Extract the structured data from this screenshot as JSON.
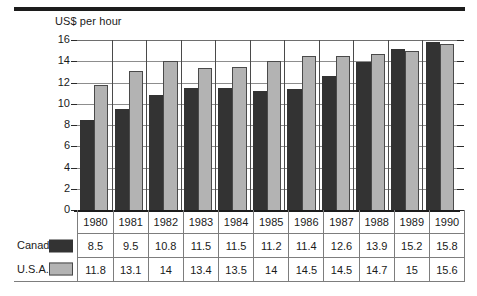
{
  "chart_data": {
    "type": "bar",
    "title": "",
    "subtitle": "",
    "ylabel": "US$ per hour",
    "xlabel": "",
    "ylim": [
      0,
      16
    ],
    "yticks": [
      0,
      2,
      4,
      6,
      8,
      10,
      12,
      14,
      16
    ],
    "grid": true,
    "legend_position": "table-left",
    "categories": [
      "1980",
      "1981",
      "1982",
      "1983",
      "1984",
      "1985",
      "1986",
      "1987",
      "1988",
      "1989",
      "1990"
    ],
    "series": [
      {
        "name": "Canada",
        "color": "#333333",
        "values": [
          8.5,
          9.5,
          10.8,
          11.5,
          11.5,
          11.2,
          11.4,
          12.6,
          13.9,
          15.2,
          15.8
        ],
        "labels": [
          "8.5",
          "9.5",
          "10.8",
          "11.5",
          "11.5",
          "11.2",
          "11.4",
          "12.6",
          "13.9",
          "15.2",
          "15.8"
        ]
      },
      {
        "name": "U.S.A.",
        "color": "#b3b3b3",
        "values": [
          11.8,
          13.1,
          14,
          13.4,
          13.5,
          14,
          14.5,
          14.5,
          14.7,
          15,
          15.6
        ],
        "labels": [
          "11.8",
          "13.1",
          "14",
          "13.4",
          "13.5",
          "14",
          "14.5",
          "14.5",
          "14.7",
          "15",
          "15.6"
        ]
      }
    ]
  },
  "table": {
    "row_header_blank": "",
    "series_names": [
      "Canada",
      "U.S.A."
    ]
  },
  "colors": {
    "canada": "#333333",
    "usa": "#b3b3b3",
    "rule": "#1c1c1c",
    "grid": "#8d8d8d",
    "border": "#7d7d7d"
  }
}
